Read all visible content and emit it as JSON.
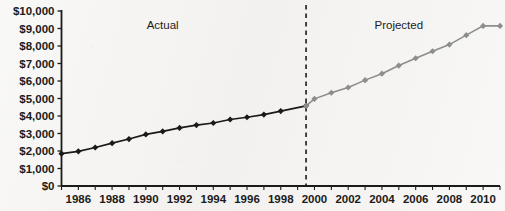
{
  "chart_data": {
    "type": "line",
    "title": "",
    "xlabel": "",
    "ylabel": "",
    "grid": false,
    "legend_position": "inline-annotations",
    "xlim": [
      1985,
      2011
    ],
    "ylim": [
      0,
      10000
    ],
    "y_tick_labels": [
      "$10,000",
      "$9,000",
      "$8,000",
      "$7,000",
      "$6,000",
      "$5,000",
      "$4,000",
      "$3,000",
      "$2,000",
      "$1,000",
      "$0"
    ],
    "y_tick_values": [
      10000,
      9000,
      8000,
      7000,
      6000,
      5000,
      4000,
      3000,
      2000,
      1000,
      0
    ],
    "x_tick_labels": [
      "1986",
      "1988",
      "1990",
      "1992",
      "1994",
      "1996",
      "1998",
      "2000",
      "2002",
      "2004",
      "2006",
      "2008",
      "2010"
    ],
    "x_tick_values": [
      1986,
      1988,
      1990,
      1992,
      1994,
      1996,
      1998,
      2000,
      2002,
      2004,
      2006,
      2008,
      2010
    ],
    "x_minor_ticks": [
      1985,
      1986,
      1987,
      1988,
      1989,
      1990,
      1991,
      1992,
      1993,
      1994,
      1995,
      1996,
      1997,
      1998,
      1999,
      2000,
      2001,
      2002,
      2003,
      2004,
      2005,
      2006,
      2007,
      2008,
      2009,
      2010,
      2011
    ],
    "annotations": [
      {
        "text": "Actual",
        "x": 1991,
        "y": 9000
      },
      {
        "text": "Projected",
        "x": 2005,
        "y": 9000
      }
    ],
    "divider": {
      "x": 1999.5,
      "style": "dashed",
      "color": "#1b1b1b"
    },
    "series": [
      {
        "name": "Actual",
        "color": "#1a1a1a",
        "marker": "diamond",
        "x": [
          1985,
          1986,
          1987,
          1988,
          1989,
          1990,
          1991,
          1992,
          1993,
          1994,
          1995,
          1996,
          1997,
          1998,
          1999.5
        ],
        "values": [
          1850,
          1980,
          2200,
          2450,
          2680,
          2950,
          3120,
          3320,
          3480,
          3600,
          3800,
          3930,
          4080,
          4280,
          4580
        ]
      },
      {
        "name": "Projected",
        "color": "#8d8d8d",
        "marker": "diamond",
        "x": [
          1999.5,
          2000,
          2001,
          2002,
          2003,
          2004,
          2005,
          2006,
          2007,
          2008,
          2009,
          2010,
          2011
        ],
        "values": [
          4580,
          4980,
          5330,
          5630,
          6050,
          6420,
          6880,
          7300,
          7700,
          8080,
          8620,
          9150,
          9150
        ]
      }
    ]
  }
}
